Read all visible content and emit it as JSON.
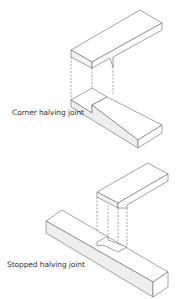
{
  "figures": [
    {
      "label": "Corner halving joint"
    },
    {
      "label": "Stopped halving joint"
    }
  ],
  "colors": {
    "line": "#555555",
    "shade": "#ececec",
    "background": "#ffffff"
  }
}
